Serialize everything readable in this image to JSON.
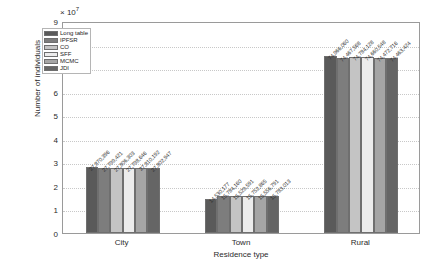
{
  "chart_data": {
    "type": "bar",
    "title": "",
    "xlabel": "Residence type",
    "ylabel": "Number of individuals",
    "y_exponent_label": "× 10",
    "y_exponent_power": "7",
    "ylim": [
      0,
      9
    ],
    "y_scale": 10000000,
    "yticks": [
      "0",
      "1",
      "2",
      "3",
      "4",
      "5",
      "6",
      "7",
      "8",
      "9"
    ],
    "categories": [
      "City",
      "Town",
      "Rural"
    ],
    "grid": true,
    "legend_position": "upper-left-inside",
    "series": [
      {
        "name": "Long table",
        "color": "#5a5a5a",
        "values": [
          27870396,
          14530177,
          74966060
        ],
        "labels": [
          "27,870,396",
          "14,530,177",
          "74,966,060"
        ]
      },
      {
        "name": "IPFSR",
        "color": "#7d7d7d",
        "values": [
          27799421,
          15784160,
          74467568
        ],
        "labels": [
          "27,799,421",
          "15,784,160",
          "74,467,568"
        ]
      },
      {
        "name": "CO",
        "color": "#c4c4c4",
        "values": [
          27806303,
          15529591,
          74784128
        ],
        "labels": [
          "27,806,303",
          "15,529,591",
          "74,784,128"
        ]
      },
      {
        "name": "SFF",
        "color": "#ececec",
        "values": [
          27798646,
          15752865,
          74660548
        ],
        "labels": [
          "27,798,646",
          "15,752,865",
          "74,660,548"
        ]
      },
      {
        "name": "MCMC",
        "color": "#a5a5a5",
        "values": [
          27810192,
          15556791,
          74472716
        ],
        "labels": [
          "27,810,192",
          "15,556,791",
          "74,472,716"
        ]
      },
      {
        "name": "JDI",
        "color": "#656565",
        "values": [
          27802947,
          15783013,
          74463424
        ],
        "labels": [
          "27,802,947",
          "15,783,013",
          "74,463,424"
        ]
      }
    ]
  }
}
